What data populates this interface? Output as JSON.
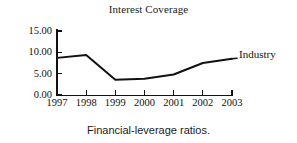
{
  "chart_data": {
    "type": "line",
    "title": "Interest Coverage",
    "caption": "Financial-leverage ratios.",
    "xlabel": "",
    "ylabel": "",
    "categories": [
      "1997",
      "1998",
      "1999",
      "2000",
      "2001",
      "2002",
      "2003"
    ],
    "series": [
      {
        "name": "Industry",
        "label": "Industry",
        "values": [
          8.7,
          9.4,
          3.6,
          3.8,
          4.8,
          7.5,
          8.5
        ],
        "color": "#111111"
      }
    ],
    "ylim": [
      0,
      15
    ],
    "yticks": [
      0,
      5,
      10,
      15
    ],
    "ytick_labels": [
      "0.00",
      "5.00",
      "10.00",
      "15.00"
    ],
    "xtick_labels": [
      "1997",
      "1998",
      "1999",
      "2000",
      "2001",
      "2002",
      "2003"
    ],
    "grid": false,
    "legend_position": "inline-right"
  }
}
